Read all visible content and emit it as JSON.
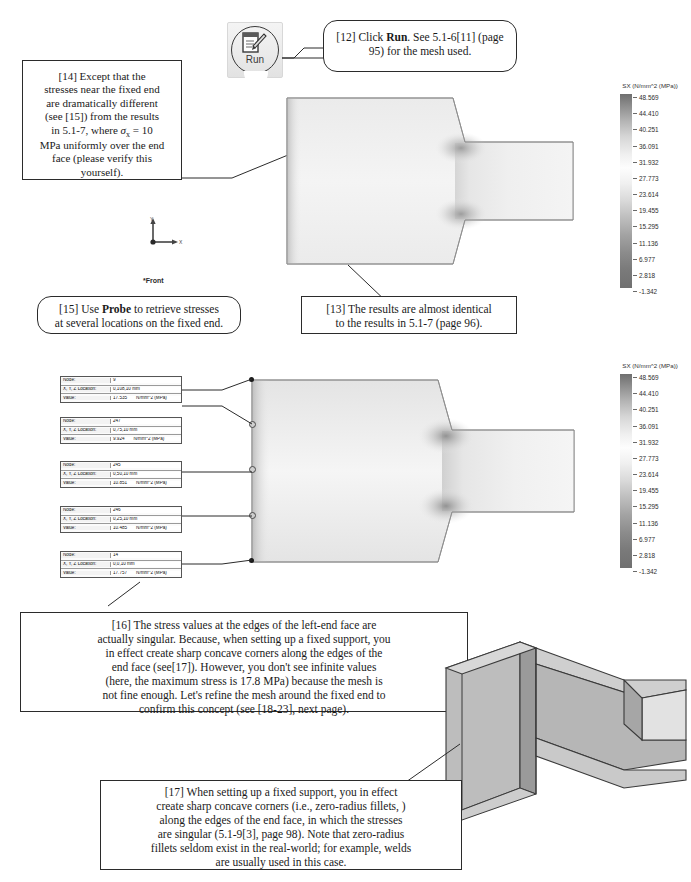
{
  "toolbar": {
    "run_button_label": "Run",
    "run_icon": "run-solve-icon"
  },
  "callouts": [
    {
      "id": "c12",
      "text_parts": [
        "[12] Click ",
        "Run",
        ". See 5.1-6[11] (page 95) for the mesh used."
      ],
      "plain": "[12] Click Run. See 5.1-6[11] (page 95) for the mesh used."
    },
    {
      "id": "c14",
      "plain": "[14] Except that the stresses near the fixed end are dramatically different (see [15]) from the results in 5.1-7, where σx = 10 MPa uniformly over the end face (please verify this yourself).",
      "lead": "[14] Except that the",
      "l2": "stresses near the fixed end",
      "l3": "are dramatically different",
      "l4": "(see [15]) from the results",
      "l5a": "in 5.1-7, where ",
      "sigma": "σ",
      "sigma_sub": "x",
      "l5b": " = 10",
      "l6": "MPa uniformly over the end",
      "l7": "face (please verify this",
      "l8": "yourself)."
    },
    {
      "id": "c13",
      "plain": "[13] The results are almost identical to the results in 5.1-7 (page 96).",
      "l1": "[13] The results are almost identical",
      "l2": "to the results in 5.1-7 (page 96)."
    },
    {
      "id": "c15",
      "plain": "[15] Use Probe to retrieve stresses at several locations on the fixed end.",
      "l1a": "[15] Use ",
      "l1b": "Probe",
      "l1c": " to retrieve stresses",
      "l2": "at several locations on the fixed end."
    },
    {
      "id": "c16",
      "plain": "[16] The stress values at the edges of the left-end face are actually singular. Because, when setting up a fixed support, you in effect create sharp concave corners along the edges of the end face (see[17]). However, you don't see infinite values (here, the maximum stress is 17.8 MPa) because the mesh is not fine enough. Let's refine the mesh around the fixed end to confirm this concept (see [18-23], next page).",
      "l1": "[16] The stress values at the edges of the left-end face are",
      "l2": "actually singular.  Because, when setting up a fixed support, you",
      "l3": "in effect create sharp concave corners along the edges of the",
      "l4": "end face (see[17]).  However, you don't see infinite values",
      "l5": "(here, the maximum stress is 17.8 MPa) because the mesh is",
      "l6": "not fine enough.  Let's refine the mesh around the fixed end to",
      "l7": "confirm this concept (see [18-23], next page)."
    },
    {
      "id": "c17",
      "plain": "[17] When setting up a fixed support, you in effect create sharp concave corners (i.e., zero-radius fillets, ) along the edges of the end face, in which the stresses are singular (5.1-9[3], page 98). Note that zero-radius fillets seldom exist in the real-world; for example, welds are usually used in this case.",
      "l1": "[17] When setting up a fixed support, you in effect",
      "l2": "create sharp concave corners (i.e., zero-radius fillets, )",
      "l3": "along the edges of the end face, in which the stresses",
      "l4": "are singular (5.1-9[3], page 98).  Note that zero-radius",
      "l5": "fillets seldom exist in the real-world; for example, welds",
      "l6": "are usually used in this case."
    }
  ],
  "legend": {
    "title": "SX (N/mm^2 (MPa))",
    "ticks": [
      "48.569",
      "44.410",
      "40.251",
      "36.091",
      "31.932",
      "27.773",
      "23.614",
      "19.455",
      "15.295",
      "11.136",
      "6.977",
      "2.818",
      "-1.342"
    ],
    "max": 48.569,
    "min": -1.342
  },
  "viewport": {
    "orientation_label": "*Front",
    "triad_x": "X",
    "triad_y": "Y"
  },
  "probe_table": {
    "keys": [
      "Node:",
      "X, Y, Z Location:",
      "Value:"
    ],
    "unit": "N/mm^2 (MPa)",
    "rows": [
      {
        "node": "9",
        "location": "0,108,10 mm",
        "value": "17.535"
      },
      {
        "node": "247",
        "location": "0,75,10 mm",
        "value": "9.924"
      },
      {
        "node": "245",
        "location": "0,50,10 mm",
        "value": "10.851"
      },
      {
        "node": "246",
        "location": "0,25,10 mm",
        "value": "10.485"
      },
      {
        "node": "14",
        "location": "0,0,10 mm",
        "value": "17.757"
      }
    ]
  },
  "chart_data": {
    "type": "heatmap",
    "title": "SX (N/mm^2 (MPa))",
    "colorbar_ticks": [
      48.569,
      44.41,
      40.251,
      36.091,
      31.932,
      27.773,
      23.614,
      19.455,
      15.295,
      11.136,
      6.977,
      2.818,
      -1.342
    ],
    "units": "N/mm^2 (MPa)",
    "probed_points": [
      {
        "node": 9,
        "x": 0,
        "y": 108,
        "z": 10,
        "sx": 17.535
      },
      {
        "node": 247,
        "x": 0,
        "y": 75,
        "z": 10,
        "sx": 9.924
      },
      {
        "node": 245,
        "x": 0,
        "y": 50,
        "z": 10,
        "sx": 10.851
      },
      {
        "node": 246,
        "x": 0,
        "y": 25,
        "z": 10,
        "sx": 10.485
      },
      {
        "node": 14,
        "x": 0,
        "y": 0,
        "z": 10,
        "sx": 17.757
      }
    ],
    "max_stress_note": "17.8 MPa"
  },
  "colors": {
    "line": "#2b2b2b",
    "legend_max": "#6f6f6f",
    "legend_mid": "#fdfdfd",
    "model_fill": "#e9e9e9"
  }
}
